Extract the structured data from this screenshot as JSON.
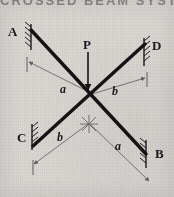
{
  "figure": {
    "title_fragment": "CROSSED BEAM SYSTEM",
    "background_color": "#d9d7d2",
    "ink_color": "#1b1b1b",
    "dimension_line_color": "#6b6b6b",
    "beam_color": "#141414"
  },
  "nodes": [
    {
      "id": "A",
      "label": "A",
      "support": "fixed",
      "x": 18,
      "y": 32
    },
    {
      "id": "D",
      "label": "D",
      "support": "fixed",
      "x": 152,
      "y": 48
    },
    {
      "id": "C",
      "label": "C",
      "support": "fixed",
      "x": 18,
      "y": 136
    },
    {
      "id": "B",
      "label": "B",
      "support": "fixed",
      "x": 155,
      "y": 156
    }
  ],
  "load": {
    "label": "P",
    "direction": "down",
    "applied_at": "beam-intersection"
  },
  "dimensions": [
    {
      "label": "a",
      "side": "upper-left",
      "from": "A-end",
      "to": "intersection"
    },
    {
      "label": "b",
      "side": "upper-right",
      "from": "intersection",
      "to": "D-end"
    },
    {
      "label": "b",
      "side": "lower-left",
      "from": "C-end",
      "to": "intersection"
    },
    {
      "label": "a",
      "side": "lower-right",
      "from": "intersection",
      "to": "B-end"
    }
  ],
  "beams": [
    {
      "id": "AB",
      "from": "A",
      "to": "B"
    },
    {
      "id": "CD",
      "from": "C",
      "to": "D"
    }
  ]
}
